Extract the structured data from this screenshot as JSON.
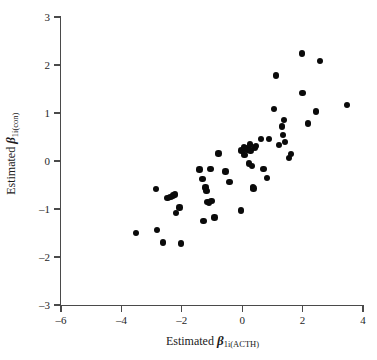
{
  "figure": {
    "background_color": "#ffffff",
    "point_color": "#0a0a0a",
    "axis_color": "#4a4a4a"
  },
  "axes": {
    "x": {
      "label_prefix": "Estimated ",
      "label_symbol": "β",
      "label_subscript": "1i(ACTH)",
      "ticks": [
        "–6",
        "–4",
        "–2",
        "0",
        "2",
        "4"
      ],
      "tick_values": [
        -6,
        -4,
        -2,
        0,
        2,
        4
      ],
      "min": -6,
      "max": 4
    },
    "y": {
      "label_prefix": "Estimated ",
      "label_symbol": "β",
      "label_subscript": "1i(con)",
      "ticks": [
        "3",
        "2",
        "1",
        "0",
        "–1",
        "–2",
        "–3"
      ],
      "tick_values": [
        3,
        2,
        1,
        0,
        -1,
        -2,
        -3
      ],
      "min": -3,
      "max": 3
    }
  },
  "chart_data": {
    "type": "scatter",
    "title": "",
    "xlabel": "Estimated β1i(ACTH)",
    "ylabel": "Estimated β1i(con)",
    "xlim": [
      -6,
      4
    ],
    "ylim": [
      -3,
      3
    ],
    "xticks": [
      -6,
      -4,
      -2,
      0,
      2,
      4
    ],
    "yticks": [
      -3,
      -2,
      -1,
      0,
      1,
      2,
      3
    ],
    "grid": false,
    "legend": null,
    "marker": "filled-circle",
    "n_points": 71,
    "points": [
      [
        -3.52,
        -1.5
      ],
      [
        -2.85,
        -0.58
      ],
      [
        -2.82,
        -1.44
      ],
      [
        -2.62,
        -1.7
      ],
      [
        -2.48,
        -0.77
      ],
      [
        -2.38,
        -0.75
      ],
      [
        -2.3,
        -0.72
      ],
      [
        -2.22,
        -0.7
      ],
      [
        -2.2,
        -1.08
      ],
      [
        -2.08,
        -0.97
      ],
      [
        -2.02,
        -1.72
      ],
      [
        -1.42,
        -0.18
      ],
      [
        -1.32,
        -0.38
      ],
      [
        -1.28,
        -1.25
      ],
      [
        -1.22,
        -0.55
      ],
      [
        -1.18,
        -0.62
      ],
      [
        -1.15,
        -0.85
      ],
      [
        -1.1,
        -0.88
      ],
      [
        -1.05,
        -0.17
      ],
      [
        -1.02,
        -0.83
      ],
      [
        -0.92,
        -1.18
      ],
      [
        -0.78,
        0.16
      ],
      [
        -0.55,
        -0.22
      ],
      [
        -0.42,
        -0.44
      ],
      [
        -0.05,
        -1.03
      ],
      [
        -0.02,
        0.22
      ],
      [
        0.05,
        0.28
      ],
      [
        0.08,
        0.12
      ],
      [
        0.12,
        0.26
      ],
      [
        0.18,
        0.24
      ],
      [
        0.22,
        -0.05
      ],
      [
        0.25,
        0.34
      ],
      [
        0.28,
        0.22
      ],
      [
        0.32,
        -0.1
      ],
      [
        0.35,
        -0.55
      ],
      [
        0.38,
        -0.57
      ],
      [
        0.42,
        0.28
      ],
      [
        0.46,
        0.31
      ],
      [
        0.62,
        0.46
      ],
      [
        0.7,
        -0.17
      ],
      [
        0.82,
        -0.35
      ],
      [
        0.88,
        0.46
      ],
      [
        1.05,
        1.08
      ],
      [
        1.12,
        1.78
      ],
      [
        1.22,
        0.33
      ],
      [
        1.32,
        0.72
      ],
      [
        1.35,
        0.54
      ],
      [
        1.38,
        0.85
      ],
      [
        1.42,
        0.39
      ],
      [
        1.55,
        0.06
      ],
      [
        1.62,
        0.15
      ],
      [
        1.98,
        2.24
      ],
      [
        2.0,
        1.42
      ],
      [
        2.18,
        0.78
      ],
      [
        2.45,
        1.03
      ],
      [
        2.58,
        2.08
      ],
      [
        3.48,
        1.17
      ]
    ]
  }
}
